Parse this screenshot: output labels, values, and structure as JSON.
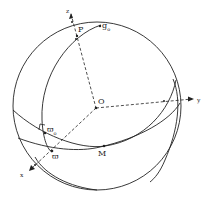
{
  "figure": {
    "labels": {
      "z_axis": "z",
      "y_axis": "y",
      "x_axis": "x",
      "origin": "O",
      "pole": "P",
      "g0": "g",
      "g0_sub": "o",
      "varpi0": "ϖ",
      "varpi0_sub": "o",
      "varpi": "ϖ",
      "node": "M"
    },
    "stroke_color": "#222222",
    "background": "#ffffff"
  }
}
